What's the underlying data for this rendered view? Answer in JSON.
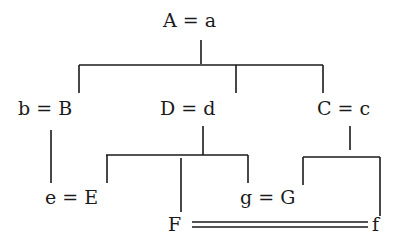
{
  "diagram": {
    "type": "genealogy-tree",
    "nodes": {
      "root": "A = a",
      "left": "b = B",
      "middle": "D = d",
      "right": "C = c",
      "left_child": "e = E",
      "mid_child_F": "F",
      "mid_child_g": "g = G",
      "right_child_f": "f"
    },
    "edges": [
      {
        "from": "A = a",
        "to": "b = B"
      },
      {
        "from": "A = a",
        "to": "D = d"
      },
      {
        "from": "A = a",
        "to": "C = c"
      },
      {
        "from": "b = B",
        "to": "e = E"
      },
      {
        "from": "D = d",
        "to": "e = E"
      },
      {
        "from": "D = d",
        "to": "F"
      },
      {
        "from": "D = d",
        "to": "g = G"
      },
      {
        "from": "C = c",
        "to": "g = G"
      },
      {
        "from": "C = c",
        "to": "f"
      },
      {
        "from": "F",
        "to": "f",
        "style": "double"
      }
    ],
    "colors": {
      "ink": "#1a1a1a",
      "background": "#ffffff"
    }
  }
}
